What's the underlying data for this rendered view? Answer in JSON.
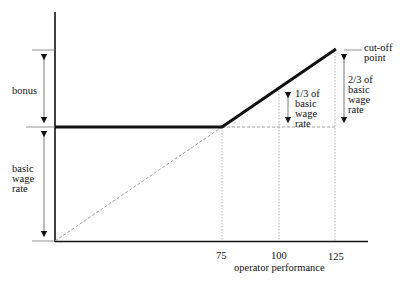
{
  "diagram": {
    "type": "incentive bonus scheme",
    "x_axis": {
      "label": "operator performance",
      "ticks": [
        "75",
        "100",
        "125"
      ]
    },
    "y_axis_annotations": {
      "bonus": "bonus",
      "basic_wage_rate": [
        "basic",
        "wage",
        "rate"
      ]
    },
    "annotations": {
      "cut_off": [
        "cut-off",
        "point"
      ],
      "one_third": [
        "1/3 of",
        "basic",
        "wage",
        "rate"
      ],
      "two_thirds": [
        "2/3 of",
        "basic",
        "wage",
        "rate"
      ]
    },
    "colors": {
      "line": "#111111",
      "guide": "#888888"
    }
  }
}
